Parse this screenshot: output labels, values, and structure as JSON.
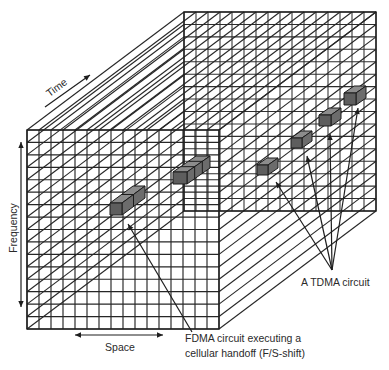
{
  "figure": {
    "labels": {
      "time": "Time",
      "frequency": "Frequency",
      "space": "Space",
      "fdma_line1": "FDMA circuit executing a",
      "fdma_line2": "cellular handoff (F/S-shift)",
      "tdma": "A TDMA circuit"
    },
    "axes": [
      "Space",
      "Frequency",
      "Time"
    ],
    "colors": {
      "line": "#262626",
      "cell_front": "#5e5e5e",
      "cell_top": "#8c8c8c",
      "cell_side": "#6c6c6c",
      "background": "#ffffff"
    },
    "grid": {
      "front_x": 27,
      "front_y": 130,
      "front_w": 192,
      "front_h": 199,
      "cols": 16,
      "rows": 16,
      "depth_dx": 157,
      "depth_dy": -118
    },
    "fdma_cells": [
      {
        "x": 110,
        "y": 203,
        "w": 12,
        "h": 12,
        "ddx": 23,
        "ddy": -17,
        "segments": 2
      },
      {
        "x": 173,
        "y": 172,
        "w": 14,
        "h": 12,
        "ddx": 23,
        "ddy": -16,
        "segments": 3
      }
    ],
    "tdma_cells": [
      {
        "x": 257,
        "y": 165,
        "w": 11,
        "h": 10,
        "ddx": 10,
        "ddy": -7,
        "segments": 1
      },
      {
        "x": 291,
        "y": 138,
        "w": 11,
        "h": 10,
        "ddx": 10,
        "ddy": -7,
        "segments": 1
      },
      {
        "x": 319,
        "y": 115,
        "w": 12,
        "h": 11,
        "ddx": 10,
        "ddy": -7,
        "segments": 1
      },
      {
        "x": 344,
        "y": 93,
        "w": 12,
        "h": 12,
        "ddx": 10,
        "ddy": -7,
        "segments": 1
      }
    ],
    "fdma_pointer": {
      "from": [
        192,
        332
      ],
      "to": [
        128,
        224
      ]
    },
    "tdma_pointers": {
      "apex": [
        332,
        270
      ],
      "targets": [
        [
          276,
          182
        ],
        [
          307,
          156
        ],
        [
          330,
          134
        ],
        [
          358,
          108
        ]
      ]
    },
    "axis_arrows": {
      "time": {
        "from": [
          45,
          107
        ],
        "to": [
          90,
          75
        ]
      },
      "frequency": {
        "from": [
          21,
          307
        ],
        "to": [
          21,
          142
        ]
      },
      "space": {
        "from": [
          75,
          335
        ],
        "to": [
          163,
          335
        ]
      }
    }
  }
}
